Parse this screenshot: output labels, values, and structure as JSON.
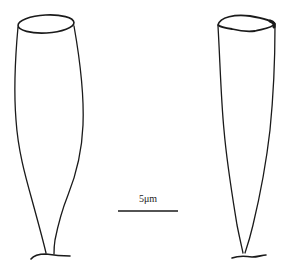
{
  "figure": {
    "type": "line-drawing",
    "subjects": [
      {
        "id": "specimen-left",
        "shape": "elongated vase-shaped lorica with open oval aperture and short stalked base"
      },
      {
        "id": "specimen-right",
        "shape": "elongated conical lorica with open oval aperture, tapering to a point with short base"
      }
    ],
    "stroke_color": "#1a1a1a",
    "background": "#ffffff"
  },
  "scale_bar": {
    "label": "5μm",
    "length_px": 60
  }
}
